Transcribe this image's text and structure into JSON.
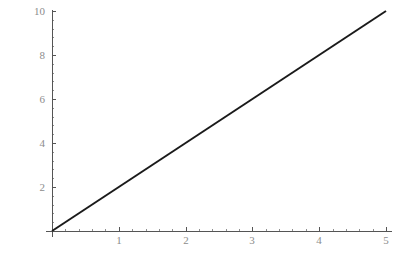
{
  "chart_data": {
    "type": "line",
    "title": "",
    "subtitle": "",
    "xlabel": "",
    "ylabel": "",
    "xlim": [
      0,
      5
    ],
    "ylim": [
      0,
      10
    ],
    "grid": false,
    "legend": null,
    "x_ticks": [
      0,
      1,
      2,
      3,
      4,
      5
    ],
    "x_tick_labels": [
      "",
      "1",
      "2",
      "3",
      "4",
      "5"
    ],
    "y_ticks": [
      0,
      2,
      4,
      6,
      8,
      10
    ],
    "y_tick_labels": [
      "",
      "2",
      "4",
      "6",
      "8",
      "10"
    ],
    "x_minor_ticks_between": 4,
    "y_minor_ticks_between": 4,
    "series": [
      {
        "name": "y = 2x",
        "x": [
          0,
          5
        ],
        "values": [
          0,
          10
        ],
        "color": "#1a1a1a"
      }
    ],
    "colors": {
      "background": "#ffffff",
      "axis": "#555555",
      "minor_tick": "#8f8f8f",
      "tick_label": "#8c8c8c",
      "data_line": "#1a1a1a"
    }
  },
  "plot": {
    "geometry": {
      "origin_x": 52,
      "origin_y": 231,
      "x_unit_px": 66.8,
      "y_unit_px": 22,
      "x_axis_end_px": 392,
      "y_axis_end_px": 10,
      "major_tick_len": 4,
      "minor_tick_len": 2
    }
  }
}
